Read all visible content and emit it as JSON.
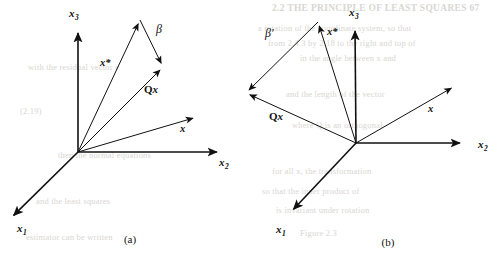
{
  "figure": {
    "background_color": "#ffffff",
    "stroke_color": "#111111",
    "panels": [
      {
        "id": "a",
        "caption": "(a)",
        "caption_pos": [
          130,
          243
        ],
        "origin": [
          78,
          152
        ],
        "axes": [
          {
            "name": "x3",
            "label_base": "x",
            "label_sub": "3",
            "tip": [
              78,
              28
            ],
            "label_pos": [
              69,
              17
            ],
            "width": 1.6
          },
          {
            "name": "x2",
            "label_base": "x",
            "label_sub": "2",
            "tip": [
              222,
              152
            ],
            "label_pos": [
              219,
              166
            ],
            "width": 1.6
          },
          {
            "name": "x1",
            "label_base": "x",
            "label_sub": "1",
            "tip": [
              10,
              219
            ],
            "label_pos": [
              17,
              232
            ],
            "width": 1.6
          }
        ],
        "vectors": [
          {
            "name": "x-star",
            "label": "x*",
            "tip": [
              140,
              20
            ],
            "label_pos": [
              100,
              66
            ],
            "width": 1.0
          },
          {
            "name": "Qx",
            "label": "Qx",
            "tip": [
              163,
              67
            ],
            "label_pos": [
              144,
              93
            ],
            "width": 1.0
          },
          {
            "name": "x",
            "label": "x",
            "tip": [
              197,
              117
            ],
            "label_pos": [
              180,
              132
            ],
            "width": 1.0
          }
        ],
        "angle_arc": {
          "name": "beta",
          "label": "β",
          "label_pos": [
            156,
            33
          ],
          "from": [
            140,
            20
          ],
          "to": [
            163,
            67
          ]
        }
      },
      {
        "id": "b",
        "caption": "(b)",
        "caption_pos": [
          388,
          246
        ],
        "origin": [
          356,
          143
        ],
        "axes": [
          {
            "name": "x3",
            "label_base": "x",
            "label_sub": "3",
            "tip": [
              355,
              26
            ],
            "label_pos": [
              349,
              16
            ],
            "width": 1.6
          },
          {
            "name": "x2",
            "label_base": "x",
            "label_sub": "2",
            "tip": [
              465,
              143
            ],
            "label_pos": [
              478,
              148
            ],
            "width": 1.6
          },
          {
            "name": "x1",
            "label_base": "x",
            "label_sub": "1",
            "tip": [
              290,
              213
            ],
            "label_pos": [
              276,
              233
            ],
            "width": 1.6
          }
        ],
        "vectors": [
          {
            "name": "x-star",
            "label": "x*",
            "tip": [
              318,
              22
            ],
            "label_pos": [
              327,
              35
            ],
            "width": 1.0
          },
          {
            "name": "Qx",
            "label": "Qx",
            "tip": [
              246,
              93
            ],
            "label_pos": [
              269,
              120
            ],
            "width": 1.0
          },
          {
            "name": "x",
            "label": "x",
            "tip": [
              455,
              86
            ],
            "label_pos": [
              428,
              112
            ],
            "width": 1.0
          }
        ],
        "angle_arc": {
          "name": "beta-prime",
          "label": "β′",
          "label_pos": [
            265,
            37
          ],
          "from": [
            318,
            22
          ],
          "to": [
            246,
            93
          ]
        }
      }
    ]
  },
  "bleed_text": {
    "line1": "2.2 THE PRINCIPLE OF LEAST SQUARES   67",
    "line2": "a rotation of the coordinate system, so that",
    "line3": "from 2.4.3 by 2.18 to the right and top of",
    "line4": "in the angle between x and",
    "line5": "and the length of the vector",
    "line6": "where Q is an orthogonal",
    "line7": "for all x, the transformation",
    "line8": "so that the inner product of",
    "line9": "is invariant under rotation",
    "line10": "with the residual vector e",
    "line11": "then the normal equations",
    "line12": "and the least squares",
    "line13": "estimator can be written",
    "line14": "Figure 2.3",
    "line15": "(2.19)"
  }
}
